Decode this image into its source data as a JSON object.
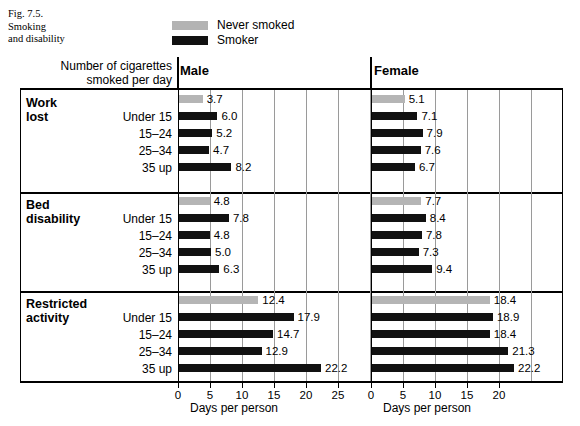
{
  "caption": {
    "number": "Fig. 7.5.",
    "line1": "Smoking",
    "line2": "and disability"
  },
  "legend": {
    "items": [
      {
        "label": "Never smoked",
        "swatch": "#b3b3b3",
        "key": "never"
      },
      {
        "label": "Smoker",
        "swatch": "#111111",
        "key": "smoker"
      }
    ]
  },
  "header": {
    "row_header_line1": "Number of cigarettes",
    "row_header_line2": "smoked per day",
    "panel_male": "Male",
    "panel_female": "Female"
  },
  "axis": {
    "title": "Days per person",
    "male_ticks": [
      "0",
      "5",
      "10",
      "15",
      "20",
      "25"
    ],
    "female_ticks": [
      "0",
      "5",
      "10",
      "15",
      "20"
    ]
  },
  "groups": [
    {
      "label_line1": "Work",
      "label_line2": "lost"
    },
    {
      "label_line1": "Bed",
      "label_line2": "disability"
    },
    {
      "label_line1": "Restricted",
      "label_line2": "activity"
    }
  ],
  "categories": [
    "",
    "Under 15",
    "15–24",
    "25–34",
    "35 up"
  ],
  "chart_data": {
    "type": "bar",
    "orientation": "horizontal",
    "title": "Smoking and disability",
    "xlabel": "Days per person",
    "ylabel": "Number of cigarettes smoked per day",
    "grid": true,
    "legend_position": "top",
    "panels": [
      {
        "name": "Male",
        "xlim": [
          0,
          27.5
        ],
        "xticks": [
          0,
          5,
          10,
          15,
          20,
          25
        ],
        "groups": [
          {
            "name": "Work lost",
            "bars": [
              {
                "category": "Never smoked",
                "series": "never",
                "value": 3.7,
                "label": "3.7"
              },
              {
                "category": "Under 15",
                "series": "smoker",
                "value": 6.0,
                "label": "6.0"
              },
              {
                "category": "15–24",
                "series": "smoker",
                "value": 5.2,
                "label": "5.2"
              },
              {
                "category": "25–34",
                "series": "smoker",
                "value": 4.7,
                "label": "4.7"
              },
              {
                "category": "35 up",
                "series": "smoker",
                "value": 8.2,
                "label": "8.2"
              }
            ]
          },
          {
            "name": "Bed disability",
            "bars": [
              {
                "category": "Never smoked",
                "series": "never",
                "value": 4.8,
                "label": "4.8"
              },
              {
                "category": "Under 15",
                "series": "smoker",
                "value": 7.8,
                "label": "7.8"
              },
              {
                "category": "15–24",
                "series": "smoker",
                "value": 4.8,
                "label": "4.8"
              },
              {
                "category": "25–34",
                "series": "smoker",
                "value": 5.0,
                "label": "5.0"
              },
              {
                "category": "35 up",
                "series": "smoker",
                "value": 6.3,
                "label": "6.3"
              }
            ]
          },
          {
            "name": "Restricted activity",
            "bars": [
              {
                "category": "Never smoked",
                "series": "never",
                "value": 12.4,
                "label": "12.4"
              },
              {
                "category": "Under 15",
                "series": "smoker",
                "value": 17.9,
                "label": "17.9"
              },
              {
                "category": "15–24",
                "series": "smoker",
                "value": 14.7,
                "label": "14.7"
              },
              {
                "category": "25–34",
                "series": "smoker",
                "value": 12.9,
                "label": "12.9"
              },
              {
                "category": "35 up",
                "series": "smoker",
                "value": 22.2,
                "label": "22.2"
              }
            ]
          }
        ]
      },
      {
        "name": "Female",
        "xlim": [
          0,
          27.5
        ],
        "xticks": [
          0,
          5,
          10,
          15,
          20
        ],
        "groups": [
          {
            "name": "Work lost",
            "bars": [
              {
                "category": "Never smoked",
                "series": "never",
                "value": 5.1,
                "label": "5.1"
              },
              {
                "category": "Under 15",
                "series": "smoker",
                "value": 7.1,
                "label": "7.1"
              },
              {
                "category": "15–24",
                "series": "smoker",
                "value": 7.9,
                "label": "7.9"
              },
              {
                "category": "25–34",
                "series": "smoker",
                "value": 7.6,
                "label": "7.6"
              },
              {
                "category": "35 up",
                "series": "smoker",
                "value": 6.7,
                "label": "6.7"
              }
            ]
          },
          {
            "name": "Bed disability",
            "bars": [
              {
                "category": "Never smoked",
                "series": "never",
                "value": 7.7,
                "label": "7.7"
              },
              {
                "category": "Under 15",
                "series": "smoker",
                "value": 8.4,
                "label": "8.4"
              },
              {
                "category": "15–24",
                "series": "smoker",
                "value": 7.8,
                "label": "7.8"
              },
              {
                "category": "25–34",
                "series": "smoker",
                "value": 7.3,
                "label": "7.3"
              },
              {
                "category": "35 up",
                "series": "smoker",
                "value": 9.4,
                "label": "9.4"
              }
            ]
          },
          {
            "name": "Restricted activity",
            "bars": [
              {
                "category": "Never smoked",
                "series": "never",
                "value": 18.4,
                "label": "18.4"
              },
              {
                "category": "Under 15",
                "series": "smoker",
                "value": 18.9,
                "label": "18.9"
              },
              {
                "category": "15–24",
                "series": "smoker",
                "value": 18.4,
                "label": "18.4"
              },
              {
                "category": "25–34",
                "series": "smoker",
                "value": 21.3,
                "label": "21.3"
              },
              {
                "category": "35 up",
                "series": "smoker",
                "value": 22.2,
                "label": "22.2"
              }
            ]
          }
        ]
      }
    ]
  }
}
